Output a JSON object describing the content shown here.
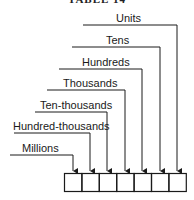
{
  "title": "TABLE 14",
  "diagram": {
    "type": "place-value",
    "labels": [
      "Units",
      "Tens",
      "Hundreds",
      "Thousands",
      "Ten-thousands",
      "Hundred-thousands",
      "Millions"
    ],
    "box_count": 7,
    "line_color": "#1a1a1a"
  }
}
